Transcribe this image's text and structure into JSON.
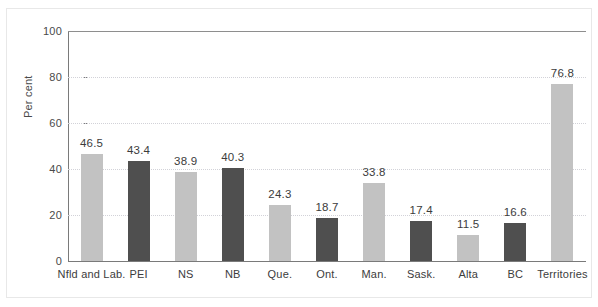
{
  "chart_data": {
    "type": "bar",
    "title": "",
    "subtitle": "",
    "xlabel": "",
    "ylabel": "Per cent",
    "ylim": [
      0,
      100
    ],
    "yticks": [
      0,
      20,
      40,
      60,
      80,
      100
    ],
    "ytick_labels": [
      "0",
      "20",
      "40",
      "60",
      "80",
      "100"
    ],
    "grid": "horizontal-dotted",
    "legend": "none",
    "categories": [
      "Nfld and Lab.",
      "PEI",
      "NS",
      "NB",
      "Que.",
      "Ont.",
      "Man.",
      "Sask.",
      "Alta",
      "BC",
      "Territories"
    ],
    "values": [
      46.5,
      43.4,
      38.9,
      40.3,
      24.3,
      18.7,
      33.8,
      17.4,
      11.5,
      16.6,
      76.8
    ],
    "value_labels": [
      "46.5",
      "43.4",
      "38.9",
      "40.3",
      "24.3",
      "18.7",
      "33.8",
      "17.4",
      "11.5",
      "16.6",
      "76.8"
    ],
    "bar_shades": [
      "light",
      "dark",
      "light",
      "dark",
      "light",
      "dark",
      "light",
      "dark",
      "light",
      "dark",
      "light"
    ],
    "colors": {
      "bar_light": "#c2c2c2",
      "bar_dark": "#4f4f4f",
      "axis": "#7a7a7a",
      "gridline": "#d2d2d8",
      "text": "#3c3c3c",
      "background": "#ffffff"
    }
  }
}
